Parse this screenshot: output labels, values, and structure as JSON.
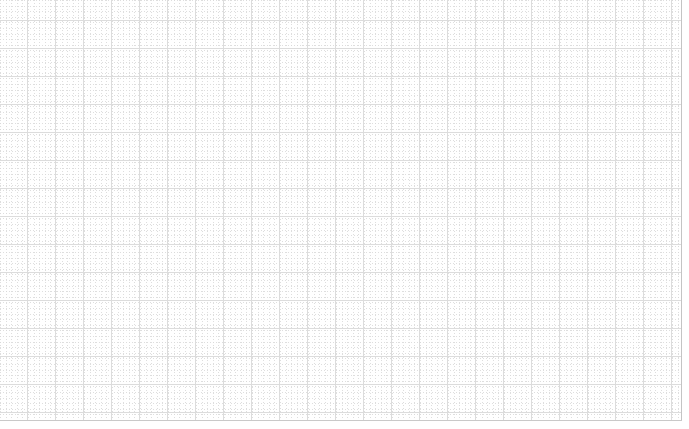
{
  "document": {
    "kind": "grid-paper-sheet",
    "title": "",
    "body_text": "",
    "annotations": []
  },
  "sheet": {
    "background_color": "#ffffff",
    "width_px": 682,
    "height_px": 421,
    "major_line_color": "#dcdcdc",
    "minor_line_color": "#d9d9d9",
    "border_color": "#c4c4c4",
    "major_spacing_px": 28,
    "minor_spacing_px": 5.6,
    "minor_per_major": 4,
    "major_origin_x_px": 27,
    "major_origin_y_px": 20
  },
  "margins": {
    "right_margin_px": 7,
    "bottom_margin_px": 8,
    "margin_color": "#ffffff"
  },
  "canvas": {
    "width_px": 689,
    "height_px": 429
  }
}
